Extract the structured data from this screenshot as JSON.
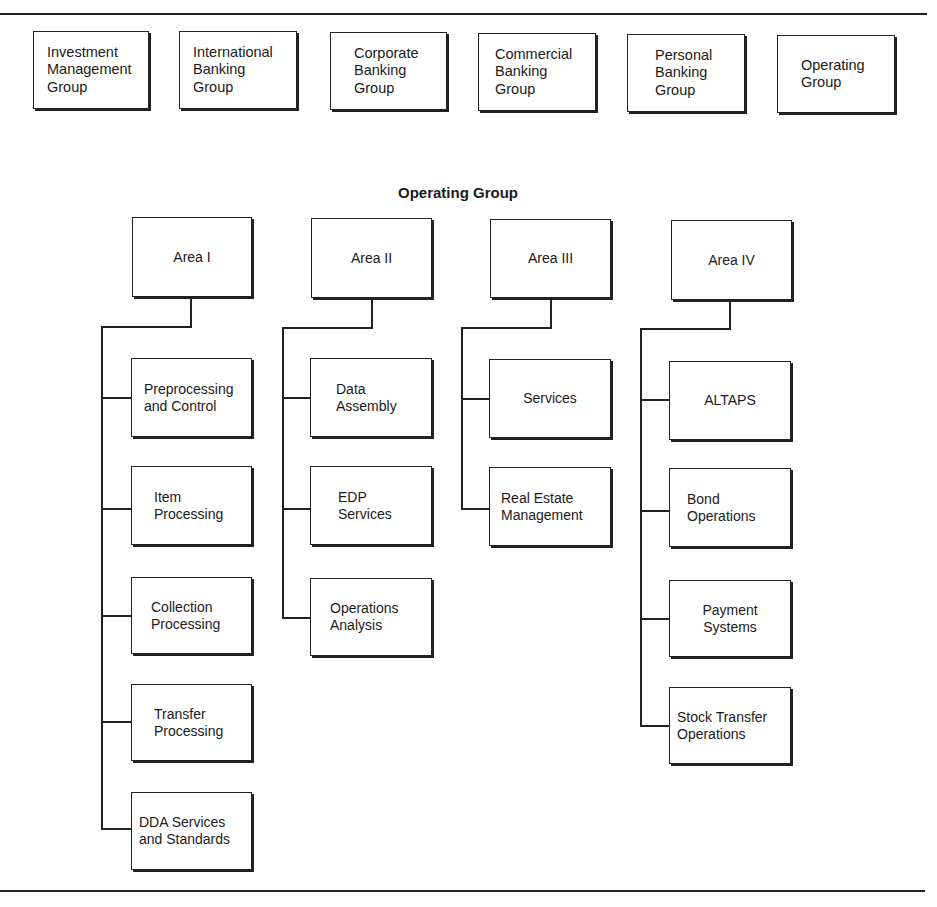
{
  "top_groups": [
    {
      "label": "Investment\nManagement\nGroup"
    },
    {
      "label": "International\nBanking\nGroup"
    },
    {
      "label": "Corporate\nBanking\nGroup"
    },
    {
      "label": "Commercial\nBanking\nGroup"
    },
    {
      "label": "Personal\nBanking\nGroup"
    },
    {
      "label": "Operating\nGroup"
    }
  ],
  "section_title": "Operating Group",
  "areas": [
    {
      "label": "Area I",
      "units": [
        {
          "label": "Preprocessing\nand Control"
        },
        {
          "label": "Item\nProcessing"
        },
        {
          "label": "Collection\nProcessing"
        },
        {
          "label": "Transfer\nProcessing"
        },
        {
          "label": "DDA Services\nand Standards"
        }
      ]
    },
    {
      "label": "Area II",
      "units": [
        {
          "label": "Data\nAssembly"
        },
        {
          "label": "EDP\nServices"
        },
        {
          "label": "Operations\nAnalysis"
        }
      ]
    },
    {
      "label": "Area III",
      "units": [
        {
          "label": "Services"
        },
        {
          "label": "Real Estate\nManagement"
        }
      ]
    },
    {
      "label": "Area IV",
      "units": [
        {
          "label": "ALTAPS"
        },
        {
          "label": "Bond\nOperations"
        },
        {
          "label": "Payment\nSystems"
        },
        {
          "label": "Stock Transfer\nOperations"
        }
      ]
    }
  ]
}
